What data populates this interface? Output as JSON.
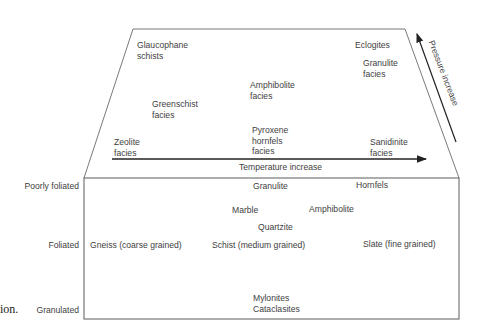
{
  "diagram": {
    "facies_panel": {
      "facies": [
        {
          "id": "glaucophane",
          "lines": [
            "Glaucophane",
            "schists"
          ]
        },
        {
          "id": "eclogites",
          "lines": [
            "Eclogites"
          ]
        },
        {
          "id": "granulite_facies",
          "lines": [
            "Granulite",
            "facies"
          ]
        },
        {
          "id": "amphibolite_facies",
          "lines": [
            "Amphibolite",
            "facies"
          ]
        },
        {
          "id": "greenschist",
          "lines": [
            "Greenschist",
            "facies"
          ]
        },
        {
          "id": "zeolite",
          "lines": [
            "Zeolite",
            "facies"
          ]
        },
        {
          "id": "pyroxene_hornfels",
          "lines": [
            "Pyroxene",
            "hornfels",
            "facies"
          ]
        },
        {
          "id": "sanidinite",
          "lines": [
            "Sanidinite",
            "facies"
          ]
        }
      ],
      "temperature_axis": "Temperature increase",
      "pressure_axis": "Pressure increase"
    },
    "rock_panel": {
      "row_labels": [
        "Poorly foliated",
        "Foliated",
        "Granulated"
      ],
      "rocks": {
        "granulite": "Granulite",
        "hornfels": "Hornfels",
        "marble": "Marble",
        "amphibolite": "Amphibolite",
        "quartzite": "Quartzite",
        "gneiss": "Gneiss (coarse grained)",
        "schist": "Schist (medium grained)",
        "slate": "Slate (fine grained)",
        "mylonites": "Mylonites",
        "cataclasites": "Cataclasites"
      }
    },
    "caption_fragment": "ion."
  }
}
